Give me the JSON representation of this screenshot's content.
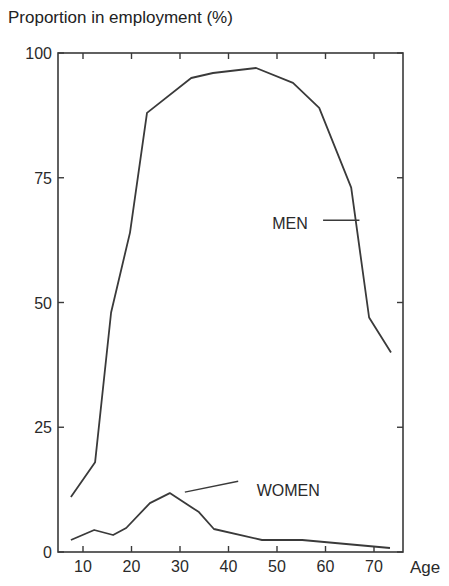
{
  "chart_data": {
    "type": "line",
    "title": "",
    "ylabel": "Proportion in employment (%)",
    "xlabel": "Age",
    "ylim": [
      0,
      100
    ],
    "xlim": [
      5,
      77
    ],
    "grid": false,
    "legend": "inline labels",
    "x_ticks": [
      10,
      20,
      30,
      40,
      50,
      60,
      70
    ],
    "y_ticks": [
      0,
      25,
      50,
      75,
      100
    ],
    "series": [
      {
        "name": "MEN",
        "points": [
          [
            7.5,
            11
          ],
          [
            12.5,
            18
          ],
          [
            15.8,
            48
          ],
          [
            19.7,
            64
          ],
          [
            23.2,
            88
          ],
          [
            32.3,
            95
          ],
          [
            36.8,
            96
          ],
          [
            45.7,
            97
          ],
          [
            53.3,
            94
          ],
          [
            58.7,
            89
          ],
          [
            65.3,
            73
          ],
          [
            69.0,
            47
          ],
          [
            73.5,
            40
          ]
        ],
        "label_pos": [
          49,
          66
        ],
        "leader": [
          [
            59.5,
            66.5
          ],
          [
            67,
            66.5
          ]
        ]
      },
      {
        "name": "WOMEN",
        "points": [
          [
            7.5,
            2.4
          ],
          [
            12.3,
            4.4
          ],
          [
            16.2,
            3.4
          ],
          [
            18.9,
            4.8
          ],
          [
            23.8,
            9.8
          ],
          [
            27.9,
            11.8
          ],
          [
            33.9,
            8.0
          ],
          [
            37.0,
            4.6
          ],
          [
            46.9,
            2.4
          ],
          [
            55.2,
            2.4
          ],
          [
            73.3,
            0.8
          ]
        ],
        "label_pos": [
          45.8,
          12.5
        ],
        "leader": [
          [
            31.0,
            12.0
          ],
          [
            42.0,
            14.2
          ]
        ]
      }
    ]
  },
  "labels": {
    "y_title": "Proportion in employment (%)",
    "x_title": "Age",
    "men": "MEN",
    "women": "WOMEN"
  }
}
